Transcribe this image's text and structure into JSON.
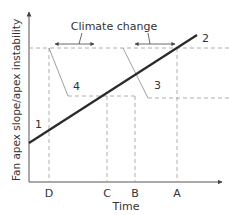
{
  "diagram": {
    "y_axis_label": "Fan apex slope/apex instability",
    "x_axis_label": "Time",
    "annotation": "Climate change",
    "line_labels": {
      "line1": "1",
      "line2": "2",
      "line3": "3",
      "line4": "4"
    },
    "time_markers": [
      "D",
      "C",
      "B",
      "A"
    ],
    "colors": {
      "main_line": "#2a2a2a",
      "dashed": "#9a9a9a",
      "axis": "#555555",
      "text": "#333333"
    }
  }
}
